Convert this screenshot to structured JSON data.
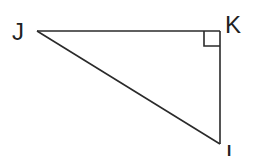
{
  "diagram": {
    "type": "right-triangle",
    "colors": {
      "stroke": "#2a2a2a",
      "label": "#222222",
      "background": "#ffffff"
    },
    "vertices": [
      {
        "id": "J",
        "label": "J",
        "x": 37,
        "y": 31
      },
      {
        "id": "K",
        "label": "K",
        "x": 220,
        "y": 31
      },
      {
        "id": "L",
        "label": "L",
        "x": 220,
        "y": 144
      }
    ],
    "right_angle_at": "K",
    "sides": [
      "JK",
      "KL",
      "JL"
    ]
  }
}
